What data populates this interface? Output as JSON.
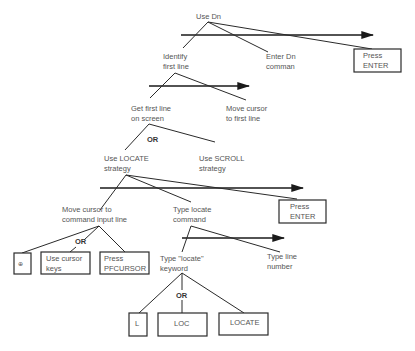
{
  "diagram": {
    "type": "goal-hierarchy",
    "nodes": {
      "use_dn": "Use Dn",
      "identify_l1": "Identify",
      "identify_l2": "first line",
      "enter_dn_l1": "Enter Dn",
      "enter_dn_l2": "comman",
      "press_enter_1_l1": "Press",
      "press_enter_1_l2": "ENTER",
      "get_first_l1": "Get first line",
      "get_first_l2": "on screen",
      "move_cursor_first_l1": "Move cursor",
      "move_cursor_first_l2": "to first line",
      "or_1": "OR",
      "locate_strategy_l1": "Use LOCATE",
      "locate_strategy_l2": "strategy",
      "scroll_strategy_l1": "Use SCROLL",
      "scroll_strategy_l2": "strategy",
      "move_cursor_cmd_l1": "Move cursor to",
      "move_cursor_cmd_l2": "command input  line",
      "type_locate_cmd_l1": "Type locate",
      "type_locate_cmd_l2": "command",
      "press_enter_2_l1": "Press",
      "press_enter_2_l2": "ENTER",
      "or_2": "OR",
      "key_symbol": "⊕",
      "cursor_keys_l1": "Use cursor",
      "cursor_keys_l2": "keys",
      "pfcursor_l1": "Press",
      "pfcursor_l2": "PFCURSOR",
      "type_keyword_l1": "Type \"locate\"",
      "type_keyword_l2": "keyword",
      "type_line_num_l1": "Type line",
      "type_line_num_l2": "number",
      "or_3": "OR",
      "kw_l": "L",
      "kw_loc": "LOC",
      "kw_locate": "LOCATE"
    }
  }
}
